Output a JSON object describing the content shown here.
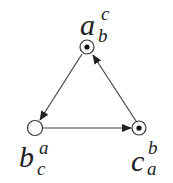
{
  "diagram": {
    "type": "directed-cycle",
    "nodes": [
      {
        "id": "a",
        "label": {
          "base": "a",
          "sup": "c",
          "sub": "b"
        },
        "fill": "dotted",
        "position": "top"
      },
      {
        "id": "b",
        "label": {
          "base": "b",
          "sup": "a",
          "sub": "c"
        },
        "fill": "empty",
        "position": "bottom-left"
      },
      {
        "id": "c",
        "label": {
          "base": "c",
          "sup": "b",
          "sub": "a"
        },
        "fill": "dotted",
        "position": "bottom-right"
      }
    ],
    "edges": [
      {
        "from": "a",
        "to": "b"
      },
      {
        "from": "b",
        "to": "c"
      },
      {
        "from": "c",
        "to": "a"
      }
    ],
    "colors": {
      "stroke": "#222222",
      "background": "#ffffff"
    }
  }
}
